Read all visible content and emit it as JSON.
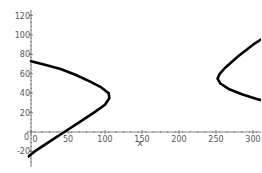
{
  "chart_data": {
    "type": "line",
    "title": "",
    "xlabel": "x",
    "ylabel": "",
    "xlim": [
      -5,
      345
    ],
    "ylim": [
      -35,
      125
    ],
    "grid": false,
    "legend": null,
    "x_ticks": [
      0,
      50,
      100,
      150,
      200,
      250,
      300
    ],
    "y_ticks": [
      -20,
      20,
      40,
      60,
      80,
      100,
      120
    ],
    "y_tick_labels": [
      "-20",
      "20",
      "40",
      "60",
      "80",
      "100",
      "120"
    ],
    "x_tick_labels": [
      "0",
      "50",
      "100",
      "150",
      "200",
      "250",
      "300"
    ],
    "origin_label": "0",
    "series": [
      {
        "name": "left-branch",
        "color": "#000000",
        "points": [
          [
            0,
            73
          ],
          [
            20,
            69
          ],
          [
            40,
            65
          ],
          [
            60,
            59
          ],
          [
            80,
            52
          ],
          [
            95,
            46
          ],
          [
            105,
            40
          ],
          [
            106,
            35
          ],
          [
            100,
            28
          ],
          [
            85,
            20
          ],
          [
            65,
            10
          ],
          [
            45,
            0
          ],
          [
            25,
            -10
          ],
          [
            5,
            -20
          ],
          [
            -3,
            -25
          ]
        ]
      },
      {
        "name": "right-branch",
        "color": "#000000",
        "points": [
          [
            340,
            110
          ],
          [
            320,
            100
          ],
          [
            300,
            90
          ],
          [
            280,
            78
          ],
          [
            262,
            66
          ],
          [
            255,
            60
          ],
          [
            252,
            55
          ],
          [
            256,
            50
          ],
          [
            268,
            44
          ],
          [
            285,
            39
          ],
          [
            305,
            34
          ],
          [
            325,
            30
          ],
          [
            340,
            28
          ]
        ]
      }
    ]
  }
}
